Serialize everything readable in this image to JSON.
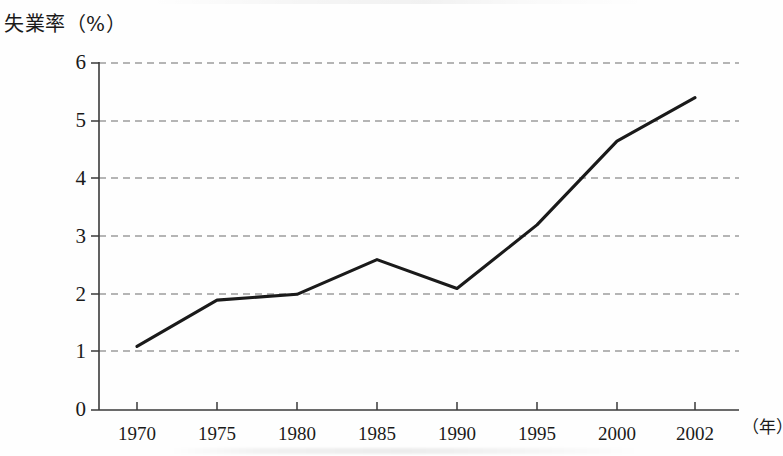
{
  "chart_data": {
    "type": "line",
    "title": "",
    "ylabel": "失業率（%）",
    "xlabel": "（年）",
    "categories": [
      "1970",
      "1975",
      "1980",
      "1985",
      "1990",
      "1995",
      "2000",
      "2002"
    ],
    "x": [
      1970,
      1975,
      1980,
      1985,
      1990,
      1995,
      2000,
      2002
    ],
    "values": [
      1.1,
      1.9,
      2.0,
      2.6,
      2.1,
      3.2,
      4.65,
      5.4
    ],
    "series": [
      {
        "name": "失業率",
        "values": [
          1.1,
          1.9,
          2.0,
          2.6,
          2.1,
          3.2,
          4.65,
          5.4
        ]
      }
    ],
    "ytick_labels": [
      "0",
      "1",
      "2",
      "3",
      "4",
      "5",
      "6"
    ],
    "ytick_values": [
      0,
      1,
      2,
      3,
      4,
      5,
      6
    ],
    "ylim": [
      0,
      6
    ],
    "xlim": [
      1970,
      2002
    ],
    "grid": "horizontal-dashed",
    "legend": "none",
    "line_color": "#1a1a1a",
    "grid_color": "#6d6d6d",
    "axis_color": "#3a3a3a",
    "background_color": "#fefefe"
  }
}
